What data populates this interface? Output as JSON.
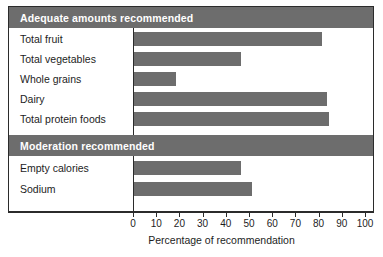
{
  "chart_data": {
    "type": "bar",
    "orientation": "horizontal",
    "title": "",
    "xlabel": "Percentage of recommendation",
    "ylabel": "",
    "xlim": [
      0,
      100
    ],
    "xticks": [
      0,
      10,
      20,
      30,
      40,
      50,
      60,
      70,
      80,
      90,
      100
    ],
    "grid": false,
    "legend": "none",
    "bar_color": "#6d6d6d",
    "groups": [
      {
        "header": "Adequate amounts recommended",
        "categories": [
          "Total fruit",
          "Total vegetables",
          "Whole grains",
          "Dairy",
          "Total protein foods"
        ],
        "values": [
          81,
          46,
          18,
          83,
          84
        ]
      },
      {
        "header": "Moderation recommended",
        "categories": [
          "Empty calories",
          "Sodium"
        ],
        "values": [
          46,
          51
        ]
      }
    ],
    "categories": [
      "Total fruit",
      "Total vegetables",
      "Whole grains",
      "Dairy",
      "Total protein foods",
      "Empty calories",
      "Sodium"
    ],
    "values": [
      81,
      46,
      18,
      83,
      84,
      46,
      51
    ]
  },
  "colors": {
    "bar": "#6d6d6d",
    "header_band": "#6d6d6d",
    "header_text": "#ffffff",
    "frame": "#2b2b2b",
    "background": "#ffffff",
    "text": "#1d1d1d"
  },
  "sections": {
    "adequate": {
      "header": "Adequate amounts recommended",
      "rows": [
        {
          "label": "Total fruit",
          "value": 81
        },
        {
          "label": "Total vegetables",
          "value": 46
        },
        {
          "label": "Whole grains",
          "value": 18
        },
        {
          "label": "Dairy",
          "value": 83
        },
        {
          "label": "Total protein foods",
          "value": 84
        }
      ]
    },
    "moderation": {
      "header": "Moderation recommended",
      "rows": [
        {
          "label": "Empty calories",
          "value": 46
        },
        {
          "label": "Sodium",
          "value": 51
        }
      ]
    }
  },
  "axis": {
    "title": "Percentage of recommendation",
    "ticks": [
      "0",
      "10",
      "20",
      "30",
      "40",
      "50",
      "60",
      "70",
      "80",
      "90",
      "100"
    ]
  }
}
